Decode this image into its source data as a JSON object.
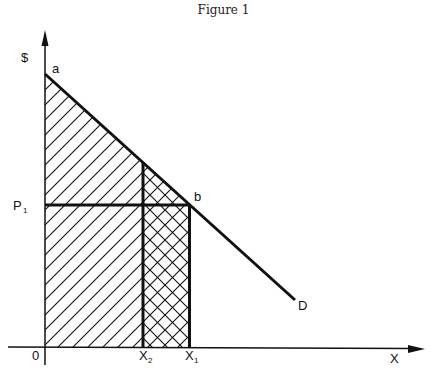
{
  "title": "Figure 1",
  "axes": {
    "y_label": "$",
    "x_label": "X",
    "origin_label": "0"
  },
  "points": {
    "a": "a",
    "b": "b",
    "D": "D"
  },
  "price_label": {
    "main": "P",
    "sub": "1"
  },
  "quantity_labels": [
    {
      "main": "X",
      "sub": "2"
    },
    {
      "main": "X",
      "sub": "1"
    }
  ],
  "colors": {
    "ink": "#111111",
    "background": "#ffffff"
  }
}
